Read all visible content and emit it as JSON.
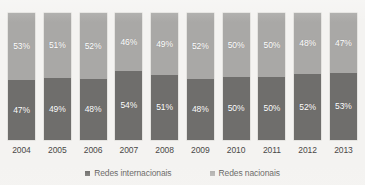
{
  "chart_data": {
    "type": "bar",
    "stacked": true,
    "stack_mode": "percent",
    "title": "Em número de conexões",
    "xlabel": "",
    "ylabel": "",
    "ylim": [
      0,
      100
    ],
    "grid": false,
    "legend_position": "bottom",
    "categories": [
      "2004",
      "2005",
      "2006",
      "2007",
      "2008",
      "2009",
      "2010",
      "2011",
      "2012",
      "2013"
    ],
    "series": [
      {
        "name": "Redes nacionais",
        "color": "#a9a8a6",
        "stack_position": "top",
        "values": [
          53,
          51,
          52,
          46,
          49,
          52,
          50,
          50,
          48,
          47
        ],
        "labels": [
          "53%",
          "51%",
          "52%",
          "46%",
          "49%",
          "52%",
          "50%",
          "50%",
          "48%",
          "47%"
        ]
      },
      {
        "name": "Redes internacionais",
        "color": "#6f6e6c",
        "stack_position": "bottom",
        "values": [
          47,
          49,
          48,
          54,
          51,
          48,
          50,
          50,
          52,
          53
        ],
        "labels": [
          "47%",
          "49%",
          "48%",
          "54%",
          "51%",
          "48%",
          "50%",
          "50%",
          "52%",
          "53%"
        ]
      }
    ]
  },
  "legend": {
    "items": [
      {
        "label": "Redes internacionais",
        "color": "#5e5d5b"
      },
      {
        "label": "Redes nacionais",
        "color": "#a9a8a6"
      }
    ]
  },
  "colors": {
    "background": "#f4f3f1",
    "series_dark": "#6f6e6c",
    "series_light": "#a9a8a6",
    "text": "#4a4947",
    "label_text": "#ffffff"
  }
}
